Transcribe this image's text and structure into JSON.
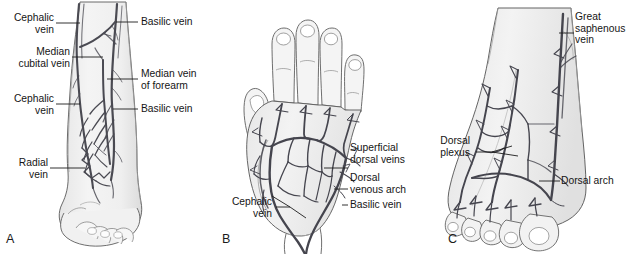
{
  "figure": {
    "background_color": "#ffffff",
    "ink_color": "#2b2b2b",
    "skin_fill": "#f0f0f0",
    "vein_color": "#4a4a52"
  },
  "panels": [
    {
      "id": "A",
      "letter": "A",
      "subject": "forearm-anterior-view",
      "labels": [
        {
          "name": "cephalic-vein-upper",
          "text": "Cephalic\nvein",
          "side": "left"
        },
        {
          "name": "median-cubital-vein",
          "text": "Median\ncubital vein",
          "side": "left"
        },
        {
          "name": "cephalic-vein-lower",
          "text": "Cephalic\nvein",
          "side": "left"
        },
        {
          "name": "radial-vein",
          "text": "Radial\nvein",
          "side": "left"
        },
        {
          "name": "basilic-vein-upper",
          "text": "Basilic vein",
          "side": "right"
        },
        {
          "name": "median-vein-of-forearm",
          "text": "Median vein\nof forearm",
          "side": "right"
        },
        {
          "name": "basilic-vein-lower",
          "text": "Basilic vein",
          "side": "right"
        }
      ]
    },
    {
      "id": "B",
      "letter": "B",
      "subject": "hand-dorsum-view",
      "labels": [
        {
          "name": "superficial-dorsal-veins",
          "text": "Superficial\ndorsal veins",
          "side": "right"
        },
        {
          "name": "dorsal-venous-arch",
          "text": "Dorsal\nvenous arch",
          "side": "right"
        },
        {
          "name": "basilic-vein",
          "text": "Basilic vein",
          "side": "right"
        },
        {
          "name": "cephalic-vein",
          "text": "Cephalic\nvein",
          "side": "left"
        }
      ]
    },
    {
      "id": "C",
      "letter": "C",
      "subject": "foot-dorsum-view",
      "labels": [
        {
          "name": "great-saphenous-vein",
          "text": "Great\nsaphenous\nvein",
          "side": "right"
        },
        {
          "name": "dorsal-plexus",
          "text": "Dorsal\nplexus",
          "side": "left"
        },
        {
          "name": "dorsal-arch",
          "text": "Dorsal arch",
          "side": "right"
        }
      ]
    }
  ]
}
